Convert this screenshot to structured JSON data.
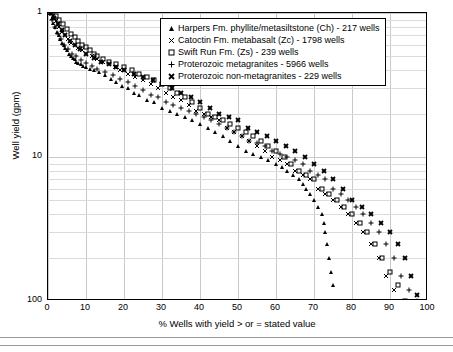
{
  "chart_data": {
    "type": "scatter",
    "title": "",
    "xlabel": "% Wells with yield > or = stated value",
    "ylabel": "Well yield (gpm)",
    "xlim": [
      0,
      100
    ],
    "ylim": [
      1,
      100
    ],
    "yscale": "log",
    "xticks": [
      0,
      10,
      20,
      30,
      40,
      50,
      60,
      70,
      80,
      90,
      100
    ],
    "yticks": [
      1,
      10,
      100
    ],
    "grid": true,
    "legend_position": "top-right",
    "series": [
      {
        "name": "Harpers Fm. phyllite/metasiltstone (Ch) - 217 wells",
        "marker": "triangle",
        "color": "#000000",
        "points": [
          [
            0.5,
            100
          ],
          [
            1.0,
            92
          ],
          [
            1.4,
            85
          ],
          [
            1.9,
            80
          ],
          [
            2.3,
            74
          ],
          [
            2.8,
            70
          ],
          [
            3.2,
            66
          ],
          [
            3.7,
            62
          ],
          [
            4.1,
            60
          ],
          [
            4.6,
            57
          ],
          [
            5.1,
            55
          ],
          [
            5.5,
            52
          ],
          [
            6.0,
            50
          ],
          [
            6.5,
            49
          ],
          [
            7.0,
            48
          ],
          [
            7.4,
            46
          ],
          [
            8.0,
            45
          ],
          [
            8.7,
            44
          ],
          [
            9.2,
            43
          ],
          [
            10.0,
            42
          ],
          [
            11.0,
            41
          ],
          [
            12.0,
            40
          ],
          [
            13.5,
            39
          ],
          [
            15.0,
            37
          ],
          [
            16.5,
            35
          ],
          [
            18.0,
            33
          ],
          [
            19.5,
            31
          ],
          [
            21.0,
            30
          ],
          [
            22.5,
            28
          ],
          [
            24.0,
            27
          ],
          [
            26.0,
            25
          ],
          [
            28.0,
            24
          ],
          [
            30.0,
            22
          ],
          [
            32.0,
            21
          ],
          [
            34.0,
            20
          ],
          [
            36.0,
            19
          ],
          [
            38.0,
            18
          ],
          [
            40.0,
            17
          ],
          [
            42.0,
            16
          ],
          [
            44.0,
            15
          ],
          [
            46.0,
            14
          ],
          [
            48.0,
            13
          ],
          [
            50.0,
            12
          ],
          [
            52.0,
            11
          ],
          [
            54.0,
            10.5
          ],
          [
            56.0,
            10
          ],
          [
            58.0,
            9.5
          ],
          [
            60.0,
            9
          ],
          [
            61.5,
            8.5
          ],
          [
            63.0,
            8
          ],
          [
            64.5,
            7.5
          ],
          [
            66.0,
            7
          ],
          [
            67.0,
            6.5
          ],
          [
            68.0,
            6
          ],
          [
            69.0,
            5.5
          ],
          [
            70.0,
            5
          ],
          [
            71.0,
            4.5
          ],
          [
            72.0,
            4
          ],
          [
            72.5,
            3.5
          ],
          [
            73.0,
            3
          ],
          [
            73.5,
            2.5
          ],
          [
            74.0,
            2
          ],
          [
            74.5,
            1.6
          ],
          [
            75.0,
            1.3
          ],
          [
            75.5,
            1.0
          ]
        ]
      },
      {
        "name": "Catoctin Fm. metabasalt (Zc) - 1798 wells",
        "marker": "x",
        "color": "#000000",
        "points": [
          [
            0.6,
            100
          ],
          [
            1.2,
            95
          ],
          [
            2.0,
            88
          ],
          [
            2.8,
            80
          ],
          [
            3.6,
            74
          ],
          [
            4.4,
            70
          ],
          [
            5.2,
            66
          ],
          [
            6.0,
            62
          ],
          [
            7.0,
            60
          ],
          [
            8.0,
            57
          ],
          [
            9.0,
            55
          ],
          [
            10.0,
            52
          ],
          [
            11.5,
            50
          ],
          [
            13.0,
            48
          ],
          [
            14.5,
            46
          ],
          [
            16.0,
            44
          ],
          [
            17.5,
            42
          ],
          [
            19.0,
            40
          ],
          [
            21.0,
            38
          ],
          [
            23.0,
            36
          ],
          [
            25.0,
            34
          ],
          [
            27.0,
            32
          ],
          [
            29.0,
            30
          ],
          [
            31.0,
            28
          ],
          [
            33.0,
            26
          ],
          [
            35.0,
            25
          ],
          [
            37.0,
            23
          ],
          [
            39.0,
            21
          ],
          [
            41.0,
            20
          ],
          [
            43.0,
            19
          ],
          [
            45.0,
            18
          ],
          [
            47.0,
            16
          ],
          [
            49.0,
            15
          ],
          [
            51.0,
            14
          ],
          [
            53.0,
            13
          ],
          [
            55.0,
            12
          ],
          [
            57.0,
            11
          ],
          [
            59.0,
            10
          ],
          [
            61.0,
            9.5
          ],
          [
            63.0,
            9
          ],
          [
            65.0,
            8
          ],
          [
            67.0,
            7.5
          ],
          [
            69.0,
            7
          ],
          [
            71.0,
            6
          ],
          [
            73.0,
            5.5
          ],
          [
            75.0,
            5
          ],
          [
            77.0,
            4.5
          ],
          [
            79.0,
            4
          ],
          [
            81.0,
            3.5
          ],
          [
            83.0,
            3
          ],
          [
            85.0,
            2.5
          ],
          [
            87.0,
            2
          ],
          [
            89.0,
            1.5
          ],
          [
            91.0,
            1.2
          ],
          [
            93.0,
            1.0
          ]
        ]
      },
      {
        "name": "Swift Run Fm. (Zs) - 239 wells",
        "marker": "square",
        "color": "#000000",
        "points": [
          [
            1.0,
            100
          ],
          [
            2.0,
            96
          ],
          [
            3.0,
            90
          ],
          [
            4.0,
            84
          ],
          [
            5.0,
            78
          ],
          [
            6.0,
            72
          ],
          [
            7.0,
            68
          ],
          [
            8.0,
            64
          ],
          [
            9.0,
            60
          ],
          [
            10.0,
            58
          ],
          [
            11.0,
            55
          ],
          [
            12.0,
            52
          ],
          [
            13.0,
            50
          ],
          [
            14.5,
            48
          ],
          [
            16.0,
            46
          ],
          [
            18.0,
            44
          ],
          [
            20.0,
            42
          ],
          [
            22.0,
            40
          ],
          [
            24.0,
            38
          ],
          [
            26.0,
            36
          ],
          [
            28.0,
            34
          ],
          [
            30.0,
            32
          ],
          [
            32.0,
            30
          ],
          [
            34.0,
            28
          ],
          [
            36.0,
            26
          ],
          [
            38.0,
            24
          ],
          [
            40.0,
            22
          ],
          [
            42.0,
            20
          ],
          [
            44.0,
            19
          ],
          [
            46.0,
            18
          ],
          [
            48.0,
            17
          ],
          [
            50.0,
            16
          ],
          [
            52.0,
            15
          ],
          [
            54.0,
            14
          ],
          [
            56.0,
            13
          ],
          [
            58.0,
            12
          ],
          [
            60.0,
            11
          ],
          [
            62.0,
            10
          ],
          [
            64.0,
            9
          ],
          [
            66.0,
            8
          ],
          [
            68.0,
            7.5
          ],
          [
            70.0,
            7
          ],
          [
            72.0,
            6
          ],
          [
            74.0,
            5.5
          ],
          [
            76.0,
            5
          ],
          [
            78.0,
            4.5
          ],
          [
            80.0,
            4
          ],
          [
            82.0,
            3.5
          ],
          [
            84.0,
            3
          ],
          [
            86.0,
            2.5
          ],
          [
            88.0,
            2
          ],
          [
            90.0,
            1.6
          ],
          [
            92.0,
            1.3
          ],
          [
            94.0,
            1.0
          ]
        ]
      },
      {
        "name": "Proterozoic metagranites - 5966 wells",
        "marker": "plus",
        "color": "#000000",
        "points": [
          [
            0.4,
            100
          ],
          [
            1.0,
            90
          ],
          [
            1.8,
            80
          ],
          [
            2.6,
            72
          ],
          [
            3.4,
            66
          ],
          [
            4.2,
            60
          ],
          [
            5.2,
            56
          ],
          [
            6.2,
            52
          ],
          [
            7.4,
            50
          ],
          [
            8.6,
            47
          ],
          [
            10.0,
            45
          ],
          [
            11.5,
            43
          ],
          [
            13.0,
            41
          ],
          [
            15.0,
            39
          ],
          [
            17.0,
            37
          ],
          [
            19.0,
            35
          ],
          [
            21.0,
            33
          ],
          [
            23.0,
            31
          ],
          [
            25.0,
            29
          ],
          [
            27.0,
            27
          ],
          [
            29.0,
            26
          ],
          [
            31.0,
            24
          ],
          [
            33.0,
            23
          ],
          [
            35.0,
            22
          ],
          [
            37.0,
            21
          ],
          [
            39.0,
            20
          ],
          [
            41.0,
            19
          ],
          [
            43.0,
            18
          ],
          [
            45.0,
            17
          ],
          [
            47.0,
            16
          ],
          [
            49.0,
            15
          ],
          [
            51.0,
            14
          ],
          [
            53.0,
            13
          ],
          [
            55.0,
            12.5
          ],
          [
            57.0,
            12
          ],
          [
            59.0,
            11
          ],
          [
            61.0,
            10.5
          ],
          [
            63.0,
            10
          ],
          [
            65.0,
            9.5
          ],
          [
            67.0,
            9
          ],
          [
            69.0,
            8
          ],
          [
            71.0,
            7.5
          ],
          [
            73.0,
            7
          ],
          [
            75.0,
            6
          ],
          [
            77.0,
            5.5
          ],
          [
            79.0,
            5
          ],
          [
            81.0,
            4.5
          ],
          [
            83.0,
            4
          ],
          [
            85.0,
            3.5
          ],
          [
            87.0,
            3
          ],
          [
            89.0,
            2.5
          ],
          [
            91.0,
            2
          ],
          [
            93.0,
            1.5
          ],
          [
            95.0,
            1.2
          ],
          [
            97.0,
            1.0
          ]
        ]
      },
      {
        "name": "Proterozoic non-metagranites - 229 wells",
        "marker": "x-bold",
        "color": "#000000",
        "points": [
          [
            0.8,
            100
          ],
          [
            1.6,
            92
          ],
          [
            2.6,
            84
          ],
          [
            3.6,
            76
          ],
          [
            4.6,
            70
          ],
          [
            5.8,
            64
          ],
          [
            7.0,
            60
          ],
          [
            8.4,
            56
          ],
          [
            10.0,
            52
          ],
          [
            12.0,
            49
          ],
          [
            14.0,
            46
          ],
          [
            16.0,
            44
          ],
          [
            18.0,
            42
          ],
          [
            20.0,
            40
          ],
          [
            22.5,
            38
          ],
          [
            25.0,
            36
          ],
          [
            27.5,
            34
          ],
          [
            30.0,
            32
          ],
          [
            32.5,
            30
          ],
          [
            35.0,
            28
          ],
          [
            37.5,
            26
          ],
          [
            40.0,
            24
          ],
          [
            42.5,
            22
          ],
          [
            45.0,
            20
          ],
          [
            47.5,
            19
          ],
          [
            50.0,
            18
          ],
          [
            52.5,
            16
          ],
          [
            55.0,
            15
          ],
          [
            57.5,
            14
          ],
          [
            60.0,
            13
          ],
          [
            62.5,
            12
          ],
          [
            65.0,
            11
          ],
          [
            67.5,
            10
          ],
          [
            70.0,
            9
          ],
          [
            72.5,
            8
          ],
          [
            75.0,
            7
          ],
          [
            77.5,
            6
          ],
          [
            80.0,
            5
          ],
          [
            82.5,
            4.5
          ],
          [
            85.0,
            4
          ],
          [
            87.5,
            3.5
          ],
          [
            90.0,
            3
          ],
          [
            92.0,
            2.5
          ],
          [
            94.0,
            2
          ],
          [
            95.5,
            1.5
          ],
          [
            97.0,
            1.1
          ]
        ]
      }
    ]
  },
  "axes": {
    "xlabel": "% Wells with yield > or = stated value",
    "ylabel": "Well yield (gpm)",
    "xticks": [
      "0",
      "10",
      "20",
      "30",
      "40",
      "50",
      "60",
      "70",
      "80",
      "90",
      "100"
    ],
    "yticks": [
      "100",
      "10",
      "1"
    ]
  },
  "legend": {
    "items": [
      {
        "marker": "triangle",
        "label": "Harpers Fm. phyllite/metasiltstone (Ch) - 217 wells"
      },
      {
        "marker": "x",
        "label": "Catoctin Fm. metabasalt (Zc) - 1798 wells"
      },
      {
        "marker": "square",
        "label": "Swift Run Fm. (Zs) - 239 wells"
      },
      {
        "marker": "plus",
        "label": "Proterozoic metagranites - 5966 wells"
      },
      {
        "marker": "x-bold",
        "label": "Proterozoic non-metagranites - 229 wells"
      }
    ]
  }
}
